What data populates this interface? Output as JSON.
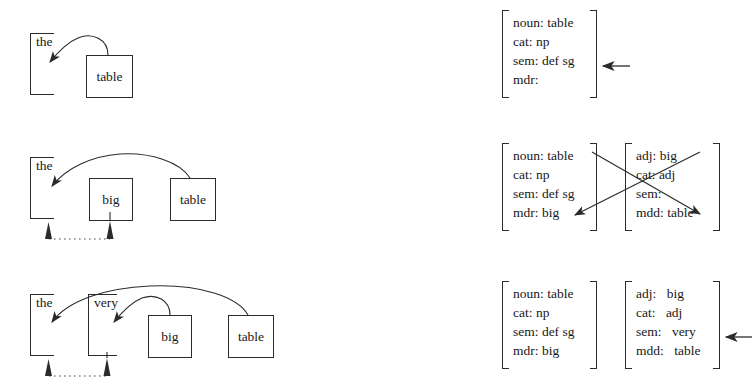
{
  "figure": {
    "background": "#ffffff",
    "ink": "#2b2b2b"
  },
  "rows": [
    {
      "id": "row-1",
      "phrase": "the table",
      "left": {
        "brackets": [
          {
            "id": "bracket-the",
            "word": "the",
            "x": 30,
            "y": 33,
            "w": 24,
            "h": 62
          }
        ],
        "boxes": [
          {
            "id": "box-table",
            "word": "table",
            "x": 86,
            "y": 55,
            "w": 47,
            "h": 43
          }
        ],
        "arrows": [
          {
            "id": "arrow-table-to-the",
            "from": "box-table-top",
            "to": "bracket-the"
          }
        ],
        "dotted_link": null
      },
      "right": {
        "avms": [
          {
            "id": "avm-noun-table-1",
            "x": 502,
            "y": 10,
            "w": 95,
            "h": 88,
            "features": [
              {
                "key": "noun:",
                "value": "table"
              },
              {
                "key": "cat:",
                "value": "np"
              },
              {
                "key": "sem:",
                "value": "def sg"
              },
              {
                "key": "mdr:",
                "value": ""
              }
            ]
          }
        ],
        "pointer": {
          "id": "pointer-row-1",
          "target": "avm-noun-table-1",
          "x": 604,
          "y": 66,
          "label": "left-arrow"
        },
        "cross_arrows": []
      }
    },
    {
      "id": "row-2",
      "phrase": "the big table",
      "left": {
        "brackets": [
          {
            "id": "bracket-the",
            "word": "the",
            "x": 30,
            "y": 157,
            "w": 24,
            "h": 62
          }
        ],
        "boxes": [
          {
            "id": "box-big",
            "word": "big",
            "x": 89,
            "y": 178,
            "w": 44,
            "h": 43
          },
          {
            "id": "box-table",
            "word": "table",
            "x": 170,
            "y": 178,
            "w": 46,
            "h": 43
          }
        ],
        "arrows": [
          {
            "id": "arrow-table-to-the",
            "from": "box-table-top",
            "to": "bracket-the"
          }
        ],
        "dotted_link": {
          "id": "dotted-link-the-big",
          "from_x": 47,
          "to_x": 110,
          "y": 238,
          "tips": [
            "arrowhead-up-the",
            "arrowhead-up-big"
          ]
        }
      },
      "right": {
        "avms": [
          {
            "id": "avm-noun-table-2",
            "x": 502,
            "y": 143,
            "w": 95,
            "h": 88,
            "features": [
              {
                "key": "noun:",
                "value": "table"
              },
              {
                "key": "cat:",
                "value": "np"
              },
              {
                "key": "sem:",
                "value": "def sg"
              },
              {
                "key": "mdr:",
                "value": "big"
              }
            ]
          },
          {
            "id": "avm-adj-big-2",
            "x": 625,
            "y": 143,
            "w": 95,
            "h": 88,
            "features": [
              {
                "key": "adj:",
                "value": "big"
              },
              {
                "key": "cat:",
                "value": "adj"
              },
              {
                "key": "sem:",
                "value": ""
              },
              {
                "key": "mdd:",
                "value": "table"
              }
            ]
          }
        ],
        "pointer": null,
        "cross_arrows": [
          {
            "id": "arrow-noun-to-mdd",
            "from": "avm-noun-table-2.noun",
            "to": "avm-adj-big-2.mdd"
          },
          {
            "id": "arrow-adj-to-mdr",
            "from": "avm-adj-big-2.adj",
            "to": "avm-noun-table-2.mdr"
          }
        ]
      }
    },
    {
      "id": "row-3",
      "phrase": "the very big table",
      "left": {
        "brackets": [
          {
            "id": "bracket-the",
            "word": "the",
            "x": 30,
            "y": 294,
            "w": 24,
            "h": 62
          },
          {
            "id": "bracket-very",
            "word": "very",
            "x": 88,
            "y": 294,
            "w": 29,
            "h": 62
          }
        ],
        "boxes": [
          {
            "id": "box-big",
            "word": "big",
            "x": 148,
            "y": 315,
            "w": 44,
            "h": 43
          },
          {
            "id": "box-table",
            "word": "table",
            "x": 228,
            "y": 315,
            "w": 46,
            "h": 43
          }
        ],
        "arrows": [
          {
            "id": "arrow-table-to-the",
            "from": "box-table-top",
            "to": "bracket-the"
          },
          {
            "id": "arrow-big-to-very",
            "from": "box-big-top",
            "to": "bracket-very"
          }
        ],
        "dotted_link": {
          "id": "dotted-link-the-very",
          "from_x": 47,
          "to_x": 107,
          "y": 375,
          "tips": [
            "arrowhead-up-the",
            "arrowhead-up-very"
          ]
        }
      },
      "right": {
        "avms": [
          {
            "id": "avm-noun-table-3",
            "x": 502,
            "y": 281,
            "w": 95,
            "h": 88,
            "features": [
              {
                "key": "noun:",
                "value": "table"
              },
              {
                "key": "cat:",
                "value": "np"
              },
              {
                "key": "sem:",
                "value": "def sg"
              },
              {
                "key": "mdr:",
                "value": "big"
              }
            ]
          },
          {
            "id": "avm-adj-big-3",
            "x": 625,
            "y": 281,
            "w": 95,
            "h": 88,
            "wide_value_gap": true,
            "features": [
              {
                "key": "adj:",
                "value": "big"
              },
              {
                "key": "cat:",
                "value": "adj"
              },
              {
                "key": "sem:",
                "value": "very"
              },
              {
                "key": "mdd:",
                "value": "table"
              }
            ]
          }
        ],
        "pointer": {
          "id": "pointer-row-3",
          "target": "avm-adj-big-3",
          "x": 727,
          "y": 337,
          "label": "left-arrow"
        },
        "cross_arrows": []
      }
    }
  ]
}
